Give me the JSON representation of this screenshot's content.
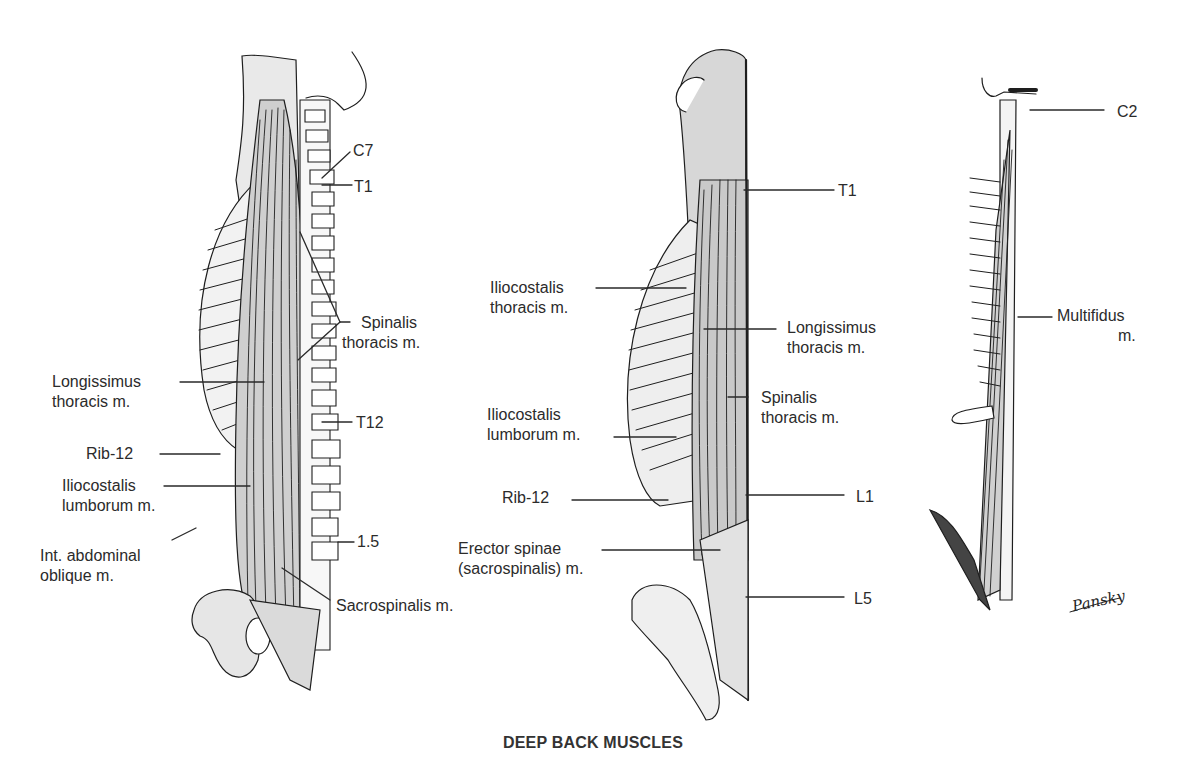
{
  "title": "DEEP BACK MUSCLES",
  "signature": "Pansky",
  "figures": [
    {
      "name": "left-figure",
      "labels": {
        "c7": "C7",
        "t1": "T1",
        "spinalis_1": "Spinalis",
        "spinalis_2": "thoracis m.",
        "longissimus_1": "Longissimus",
        "longissimus_2": "thoracis m.",
        "t12": "T12",
        "rib12": "Rib-12",
        "iliocostalis_1": "Iliocostalis",
        "iliocostalis_2": "lumborum m.",
        "l5": "1.5",
        "oblique_1": "Int. abdominal",
        "oblique_2": "oblique m.",
        "sacrospinalis": "Sacrospinalis m."
      }
    },
    {
      "name": "middle-figure",
      "labels": {
        "t1": "T1",
        "ilio_thor_1": "Iliocostalis",
        "ilio_thor_2": "thoracis m.",
        "longissimus_1": "Longissimus",
        "longissimus_2": "thoracis m.",
        "spinalis_1": "Spinalis",
        "spinalis_2": "thoracis m.",
        "ilio_lumb_1": "Iliocostalis",
        "ilio_lumb_2": "lumborum m.",
        "rib12": "Rib-12",
        "l1": "L1",
        "erector_1": "Erector spinae",
        "erector_2": "(sacrospinalis) m.",
        "l5": "L5"
      }
    },
    {
      "name": "right-figure",
      "labels": {
        "c2": "C2",
        "multifidus_1": "Multifidus",
        "multifidus_2": "m."
      }
    }
  ]
}
